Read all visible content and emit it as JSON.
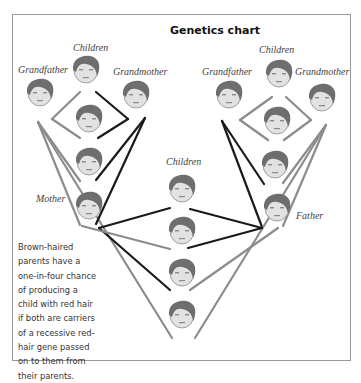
{
  "title": "Genetics chart",
  "labels": {
    "left_children": "Children",
    "left_grandfather": "Grandfather",
    "left_grandmother": "Grandmother",
    "mother": "Mother",
    "right_children": "Children",
    "right_grandfather": "Grandfather",
    "right_grandmother": "Grandmother",
    "father": "Father",
    "center_children": "Children"
  },
  "caption": "Brown-haired parents have a one-in-four chance of producing a child with red hair if both are carriers of a recessive red-hair gene passed on to them from their parents.",
  "colors": {
    "black_line": "#1a1a1a",
    "grey_line": "#8c8c8c",
    "hair": "#6e6e6e",
    "skin": "#e2e2e2",
    "border": "#9a9a9a"
  },
  "faces": [
    {
      "id": "left-child-1",
      "x": 86,
      "y": 68
    },
    {
      "id": "left-grandfather",
      "x": 40,
      "y": 91
    },
    {
      "id": "left-grandmother",
      "x": 136,
      "y": 93
    },
    {
      "id": "left-child-2",
      "x": 89,
      "y": 117
    },
    {
      "id": "left-child-3",
      "x": 89,
      "y": 160
    },
    {
      "id": "mother",
      "x": 89,
      "y": 204
    },
    {
      "id": "right-child-1",
      "x": 279,
      "y": 72
    },
    {
      "id": "right-grandfather",
      "x": 229,
      "y": 93
    },
    {
      "id": "right-grandmother",
      "x": 322,
      "y": 96
    },
    {
      "id": "right-child-2",
      "x": 277,
      "y": 119
    },
    {
      "id": "right-child-3",
      "x": 275,
      "y": 163
    },
    {
      "id": "father",
      "x": 277,
      "y": 206
    },
    {
      "id": "center-child-1",
      "x": 182,
      "y": 187
    },
    {
      "id": "center-child-2",
      "x": 182,
      "y": 229
    },
    {
      "id": "center-child-3",
      "x": 182,
      "y": 271
    },
    {
      "id": "center-child-4",
      "x": 182,
      "y": 313
    }
  ]
}
